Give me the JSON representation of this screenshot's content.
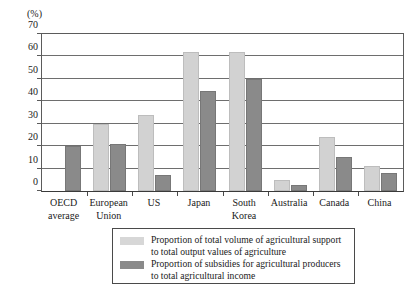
{
  "chart_data": {
    "type": "bar",
    "title": "",
    "xlabel": "",
    "ylabel": "(%)",
    "unit_label": "(%)",
    "ylim": [
      0,
      70
    ],
    "ytick_step": 10,
    "yticks": [
      0,
      10,
      20,
      30,
      40,
      50,
      60,
      70
    ],
    "grid": true,
    "legend_position": "bottom",
    "categories": [
      "OECD average",
      "European Union",
      "US",
      "Japan",
      "South Korea",
      "Australia",
      "Canada",
      "China"
    ],
    "category_lines": [
      [
        "OECD",
        "average"
      ],
      [
        "European",
        "Union"
      ],
      [
        "US",
        ""
      ],
      [
        "Japan",
        ""
      ],
      [
        "South",
        "Korea"
      ],
      [
        "Australia",
        ""
      ],
      [
        "Canada",
        ""
      ],
      [
        "China",
        ""
      ]
    ],
    "series": [
      {
        "name": "Proportion of total volume of agricultural support to total output values of agriculture",
        "color": "#d2d2d2",
        "values": [
          0,
          30,
          34,
          62,
          62,
          5,
          24,
          11
        ]
      },
      {
        "name": "Proportion of subsidies for agricultural producers to total agricultural income",
        "color": "#8a8a8a",
        "values": [
          20,
          21,
          7,
          44.5,
          50,
          2.5,
          15,
          8
        ]
      }
    ]
  },
  "legend": {
    "items": [
      {
        "swatch": "light",
        "line1": "Proportion of total volume of agricultural support",
        "line2": "to total output values of agriculture"
      },
      {
        "swatch": "dark",
        "line1": "Proportion of subsidies for agricultural producers",
        "line2": "to total agricultural income"
      }
    ]
  }
}
